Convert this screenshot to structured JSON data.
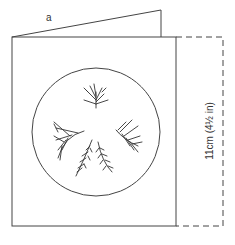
{
  "diagram": {
    "labels": {
      "flap_label": "a",
      "height_dimension": "11cm (4½ in)"
    },
    "elements": {
      "back_card": "card back panel (folded, rising behind front)",
      "front_card": "card front panel",
      "window": "circular cut-out window",
      "motif": "five feathery leaf sprigs arranged in a circle",
      "fold_extension": "dashed outline indicating card extension"
    },
    "colors": {
      "line": "#444444",
      "background": "#ffffff"
    }
  }
}
